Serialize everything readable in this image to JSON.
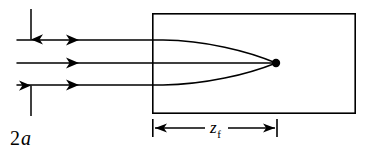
{
  "figure": {
    "background_color": "#ffffff",
    "stroke_color": "#000000",
    "width": 375,
    "height": 158
  },
  "labels": {
    "aperture": {
      "text_number": "2",
      "text_symbol": "a",
      "full": "2a",
      "x": 10,
      "y": 144
    },
    "focal_distance": {
      "text_symbol": "z",
      "subscript": "f",
      "full": "zf",
      "x": 212,
      "y": 134
    }
  },
  "medium_box": {
    "name": "medium-rectangle",
    "x": 152,
    "y": 13,
    "width": 204,
    "height": 101,
    "stroke": "#000000",
    "stroke_width": 1.6,
    "fill": "none"
  },
  "rays": [
    {
      "name": "upper-ray",
      "y": 40,
      "x_start": 17,
      "arrow_x": 78
    },
    {
      "name": "axis-ray",
      "y": 63,
      "x_start": 17,
      "arrow_x": 78
    },
    {
      "name": "lower-ray",
      "y": 85,
      "x_start": 17,
      "arrow_x": 78
    }
  ],
  "focal_point": {
    "name": "focal-point-dot",
    "x": 276,
    "y": 63,
    "radius": 4.2,
    "fill": "#000000"
  },
  "aperture_arrows": {
    "x": 31,
    "down": {
      "y_start": 8,
      "y_end": 40
    },
    "up": {
      "y_start": 116,
      "y_end": 85
    }
  },
  "dimension_line": {
    "name": "focal-length-dimension",
    "y": 128,
    "x_left": 152,
    "x_right": 277,
    "tick_half_height": 9
  },
  "colors": {
    "ink": "#000000",
    "paper": "#ffffff"
  }
}
